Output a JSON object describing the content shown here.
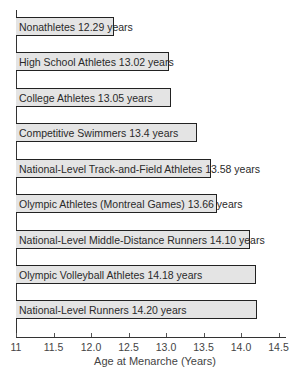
{
  "chart_data": {
    "type": "bar",
    "orientation": "horizontal",
    "title": "",
    "xlabel": "Age at Menarche (Years)",
    "ylabel": "",
    "xlim": [
      11,
      14.5
    ],
    "x_ticks": [
      "11",
      "11.5",
      "12.0",
      "12.5",
      "13.0",
      "13.5",
      "14.0",
      "14.5"
    ],
    "grid": false,
    "legend": null,
    "categories": [
      "Nonathletes",
      "High School Athletes",
      "College Athletes",
      "Competitive Swimmers",
      "National-Level Track-and-Field Athletes",
      "Olympic Athletes (Montreal Games)",
      "National-Level Middle-Distance Runners",
      "Olympic Volleyball Athletes",
      "National-Level Runners"
    ],
    "values": [
      12.29,
      13.02,
      13.05,
      13.4,
      13.58,
      13.66,
      14.1,
      14.18,
      14.2
    ],
    "bar_labels": [
      "Nonathletes 12.29 years",
      "High School Athletes 13.02 years",
      "College Athletes 13.05 years",
      "Competitive Swimmers 13.4 years",
      "National-Level Track-and-Field Athletes 13.58 years",
      "Olympic Athletes (Montreal Games) 13.66 years",
      "National-Level Middle-Distance Runners 14.10 years",
      "Olympic Volleyball Athletes 14.18 years",
      "National-Level Runners 14.20 years"
    ],
    "colors": {
      "bar_fill": "#e4e4e4",
      "bar_border": "#222222"
    }
  }
}
